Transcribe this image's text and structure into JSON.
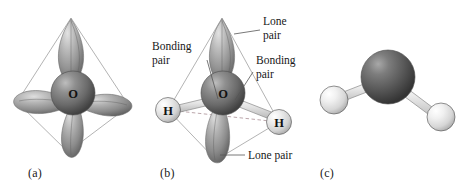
{
  "figure": {
    "background_color": "#ffffff"
  },
  "panels": [
    {
      "id": "a",
      "caption": "(a)",
      "center_atom_label": "O",
      "description": "tetrahedral hybrid orbital lobes around oxygen"
    },
    {
      "id": "b",
      "caption": "(b)",
      "center_atom_label": "O",
      "hydrogen_left_label": "H",
      "hydrogen_right_label": "H",
      "description": "orbital model with labeled lone pairs and bonding pairs"
    },
    {
      "id": "c",
      "caption": "(c)",
      "description": "ball-and-stick model of bent water molecule"
    }
  ],
  "callouts": {
    "lone_pair_top": {
      "line1": "Lone",
      "line2": "pair"
    },
    "bonding_pair_left": {
      "line1": "Bonding",
      "line2": "pair"
    },
    "bonding_pair_right": {
      "line1": "Bonding",
      "line2": "pair"
    },
    "lone_pair_bottom": {
      "line1": "Lone pair"
    }
  },
  "colors": {
    "oxygen_sphere": "#6f6f6f",
    "oxygen_sphere_dark": "#3f3f3f",
    "hydrogen_sphere": "#d8d8d8",
    "lobe_mid": "#9b9b9b",
    "lobe_dark": "#6a6a6a",
    "wireframe": "#9a9a9a",
    "hidden_edge": "#a98f95",
    "text": "#171717",
    "background": "#ffffff"
  }
}
